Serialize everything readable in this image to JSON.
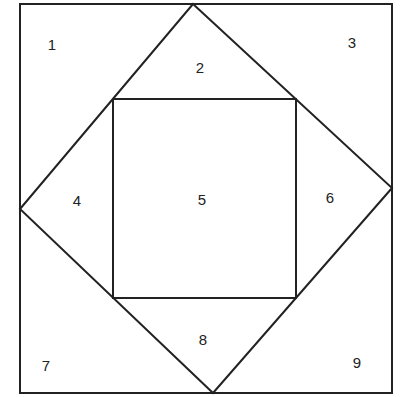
{
  "diagram": {
    "stroke": "#222222",
    "regions": [
      {
        "label": "1",
        "x": 52,
        "y": 44
      },
      {
        "label": "2",
        "x": 200,
        "y": 67
      },
      {
        "label": "3",
        "x": 352,
        "y": 42
      },
      {
        "label": "4",
        "x": 77,
        "y": 200
      },
      {
        "label": "5",
        "x": 202,
        "y": 199
      },
      {
        "label": "6",
        "x": 330,
        "y": 197
      },
      {
        "label": "7",
        "x": 46,
        "y": 365
      },
      {
        "label": "8",
        "x": 203,
        "y": 339
      },
      {
        "label": "9",
        "x": 357,
        "y": 362
      }
    ]
  }
}
